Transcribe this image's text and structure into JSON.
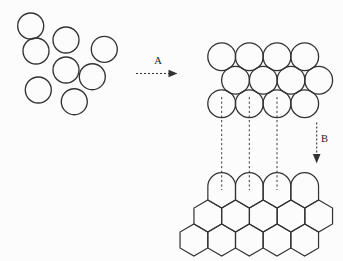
{
  "diagram": {
    "background": "#fcfcfc",
    "stroke_color": "#323232",
    "canvas": {
      "width": 343,
      "height": 261
    },
    "labels": {
      "arrow_a": "A",
      "arrow_b": "B"
    },
    "scattered_circles": {
      "radius": 13,
      "centers": [
        [
          30.7,
          26
        ],
        [
          66,
          40
        ],
        [
          104.3,
          49.3
        ],
        [
          36,
          51
        ],
        [
          66,
          70
        ],
        [
          92.3,
          76.7
        ],
        [
          38.3,
          90
        ],
        [
          74.3,
          101.7
        ]
      ]
    },
    "arrow_a": {
      "x1": 136,
      "x2": 177.5,
      "y": 73.5,
      "label_x": 158,
      "label_y": 63.5
    },
    "packed_circles": {
      "radius": 13.9,
      "rows": [
        {
          "y": 56.7,
          "xs": [
            221.7,
            249.3,
            277.0,
            304.7
          ]
        },
        {
          "y": 80.2,
          "xs": [
            235.5,
            263.3,
            291.0,
            318.7
          ]
        },
        {
          "y": 103.7,
          "xs": [
            221.7,
            249.3,
            277.0,
            304.7
          ]
        }
      ]
    },
    "guide_lines": {
      "xs": [
        221.7,
        249.3,
        277.0
      ],
      "y1": 97,
      "y2": 190
    },
    "arrow_b": {
      "x": 316.7,
      "y1": 122.5,
      "y2": 163.5,
      "label_x": 321,
      "label_y": 142
    },
    "honeycomb": {
      "hex_half_width": 13.85,
      "hex_side": 16,
      "round_top_row": {
        "y": 192,
        "arc_radius": 13.85,
        "side_top_offset": -5.5,
        "xs": [
          221.7,
          249.3,
          277.0,
          304.7
        ]
      },
      "hex_rows": [
        {
          "y": 216,
          "xs": [
            207.8,
            235.5,
            263.3,
            291.0,
            318.7
          ]
        },
        {
          "y": 240,
          "xs": [
            193.9,
            221.7,
            249.3,
            277.0,
            304.7
          ]
        }
      ]
    }
  }
}
